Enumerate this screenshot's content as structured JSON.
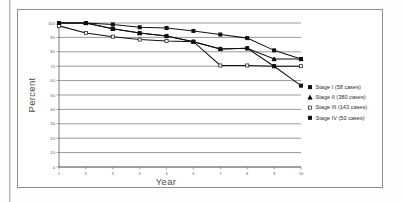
{
  "chart_data": {
    "type": "line",
    "title": "",
    "xlabel": "Year",
    "ylabel": "Percent",
    "x": [
      1,
      2,
      3,
      4,
      5,
      6,
      7,
      8,
      9,
      10
    ],
    "xlim": [
      1,
      10
    ],
    "ylim": [
      0,
      100
    ],
    "ytick_labels": [
      "0",
      "10",
      "20",
      "30",
      "40",
      "50",
      "60",
      "70",
      "80",
      "90",
      "100"
    ],
    "ytick_values": [
      0,
      10,
      20,
      30,
      40,
      50,
      60,
      70,
      80,
      90,
      100
    ],
    "xtick_labels": [
      "1",
      "2",
      "3",
      "4",
      "5",
      "6",
      "7",
      "8",
      "9",
      "10"
    ],
    "grid": "horizontal",
    "legend_position": "right",
    "series": [
      {
        "name": "Stage I (58 cases)",
        "marker": "filled-square",
        "values": [
          100,
          100,
          99,
          97,
          96.5,
          94.5,
          92,
          89.5,
          81,
          75
        ]
      },
      {
        "name": "Stage II (380 cases)",
        "marker": "filled-triangle",
        "values": [
          100,
          100,
          96,
          93,
          91,
          87,
          82,
          82.5,
          75,
          75
        ]
      },
      {
        "name": "Stage III (143 cases)",
        "marker": "open-square",
        "values": [
          98,
          93,
          90.5,
          88.5,
          87.5,
          87,
          70.5,
          70.5,
          70,
          70
        ]
      },
      {
        "name": "Stage IV (50 cases)",
        "marker": "filled-square",
        "values": [
          100,
          100,
          96,
          93,
          91,
          87,
          82,
          82.5,
          70,
          56.5
        ]
      }
    ]
  },
  "legend": {
    "entries": [
      {
        "label": "Stage I (58 cases)",
        "marker": "filled-square"
      },
      {
        "label": "Stage II (380 cases)",
        "marker": "filled-triangle"
      },
      {
        "label": "Stage III (143 cases)",
        "marker": "open-square"
      },
      {
        "label": "Stage IV (50 cases)",
        "marker": "filled-square"
      }
    ]
  },
  "colors": {
    "ink": "#111111",
    "grid": "#555555",
    "page": "#fdfdfd",
    "frame": "#8d8d8d"
  }
}
